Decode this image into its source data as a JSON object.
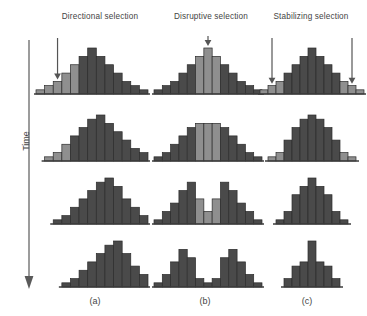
{
  "figure": {
    "axis": {
      "label": "Time",
      "direction": "downward"
    },
    "colors": {
      "bar_dark": "#4a4a4a",
      "bar_light": "#8f8f8f",
      "bar_outline": "#2b2b2b",
      "baseline": "#3d3d3d",
      "arrow": "#555555",
      "text": "#444444",
      "background": "#ffffff"
    },
    "columns": [
      {
        "id": "a",
        "title": "Directional selection",
        "panel_label": "(a)",
        "arrows": 1
      },
      {
        "id": "b",
        "title": "Disruptive selection",
        "panel_label": "(b)",
        "arrows": 1
      },
      {
        "id": "c",
        "title": "Stabilizing selection",
        "panel_label": "(c)",
        "arrows": 2
      }
    ]
  },
  "chart_data": {
    "type": "bar",
    "xlabel": "Phenotype (trait value)",
    "ylabel": "Number of individuals",
    "grid": false,
    "legend": null,
    "ylim": [
      0,
      11
    ],
    "notes": [
      "Each panel is a frequency histogram of a quantitative trait.",
      "Rows progress downward in time (generations).",
      "Light-shaded bars mark the portion of the distribution targeted by selection; arrows point at the selected phenotypes."
    ],
    "panels": [
      {
        "column": "a",
        "column_title": "Directional selection",
        "panel_label": "(a)",
        "arrows": [
          {
            "bin_index": 2,
            "label": "selection against one extreme"
          }
        ],
        "rows": [
          {
            "time_step": 1,
            "values": [
              1,
              2,
              3,
              5,
              7,
              9,
              11,
              9,
              7,
              5,
              3,
              2,
              1
            ],
            "highlighted_bins": [
              0,
              1,
              2,
              3,
              4
            ]
          },
          {
            "time_step": 2,
            "values": [
              0,
              1,
              2,
              4,
              6,
              8,
              10,
              11,
              9,
              7,
              5,
              3,
              2
            ],
            "highlighted_bins": [
              0,
              1,
              2,
              3
            ]
          },
          {
            "time_step": 3,
            "values": [
              0,
              0,
              1,
              2,
              4,
              6,
              8,
              10,
              11,
              9,
              6,
              4,
              2
            ],
            "highlighted_bins": []
          },
          {
            "time_step": 4,
            "values": [
              0,
              0,
              0,
              1,
              2,
              4,
              6,
              8,
              10,
              11,
              8,
              5,
              3
            ],
            "highlighted_bins": []
          }
        ]
      },
      {
        "column": "b",
        "column_title": "Disruptive selection",
        "panel_label": "(b)",
        "arrows": [
          {
            "bin_index": 6,
            "label": "selection against the intermediate"
          }
        ],
        "rows": [
          {
            "time_step": 1,
            "values": [
              1,
              2,
              3,
              5,
              7,
              9,
              11,
              9,
              7,
              5,
              3,
              2,
              1
            ],
            "highlighted_bins": [
              5,
              6,
              7
            ]
          },
          {
            "time_step": 2,
            "values": [
              1,
              2,
              4,
              6,
              8,
              9,
              9,
              9,
              8,
              6,
              4,
              2,
              1
            ],
            "highlighted_bins": [
              5,
              6,
              7
            ]
          },
          {
            "time_step": 3,
            "values": [
              1,
              3,
              5,
              8,
              10,
              6,
              3,
              6,
              10,
              8,
              5,
              3,
              1
            ],
            "highlighted_bins": [
              5,
              6,
              7
            ]
          },
          {
            "time_step": 4,
            "values": [
              1,
              3,
              6,
              9,
              7,
              2,
              1,
              2,
              7,
              9,
              6,
              3,
              1
            ],
            "highlighted_bins": []
          }
        ]
      },
      {
        "column": "c",
        "column_title": "Stabilizing selection",
        "panel_label": "(c)",
        "arrows": [
          {
            "bin_index": 1,
            "label": "selection against low extreme"
          },
          {
            "bin_index": 11,
            "label": "selection against high extreme"
          }
        ],
        "rows": [
          {
            "time_step": 1,
            "values": [
              1,
              2,
              3,
              5,
              7,
              9,
              11,
              9,
              7,
              5,
              3,
              2,
              1
            ],
            "highlighted_bins": [
              0,
              1,
              2,
              10,
              11,
              12
            ]
          },
          {
            "time_step": 2,
            "values": [
              0,
              1,
              2,
              5,
              8,
              10,
              11,
              10,
              8,
              5,
              2,
              1,
              0
            ],
            "highlighted_bins": [
              1,
              2,
              10,
              11
            ]
          },
          {
            "time_step": 3,
            "values": [
              0,
              0,
              1,
              3,
              7,
              9,
              11,
              9,
              7,
              3,
              1,
              0,
              0
            ],
            "highlighted_bins": []
          },
          {
            "time_step": 4,
            "values": [
              0,
              0,
              0,
              2,
              5,
              6,
              11,
              6,
              5,
              2,
              0,
              0,
              0
            ],
            "highlighted_bins": []
          }
        ]
      }
    ]
  }
}
